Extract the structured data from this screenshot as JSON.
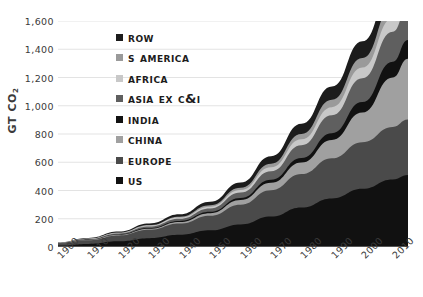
{
  "chart_data": {
    "type": "area",
    "stacked": true,
    "title": "",
    "xlabel": "",
    "ylabel": "GT CO2",
    "ylabel_html": "GT CO<sub>2</sub>",
    "x": [
      1900,
      1910,
      1920,
      1930,
      1940,
      1950,
      1960,
      1970,
      1980,
      1990,
      2000,
      2010,
      2015
    ],
    "xlim": [
      1900,
      2015
    ],
    "ylim": [
      0,
      1600
    ],
    "yticks": [
      0,
      200,
      400,
      600,
      800,
      1000,
      1200,
      1400,
      1600
    ],
    "ytick_labels": [
      "0",
      "200",
      "400",
      "600",
      "800",
      "1,000",
      "1,200",
      "1,400",
      "1,600"
    ],
    "xticks": [
      1900,
      1910,
      1920,
      1930,
      1940,
      1950,
      1960,
      1970,
      1980,
      1990,
      2000,
      2010
    ],
    "xtick_labels": [
      "1900",
      "1910",
      "1920",
      "1930",
      "1940",
      "1950",
      "1960",
      "1970",
      "1980",
      "1990",
      "2000",
      "2010"
    ],
    "grid": true,
    "grid_axis": "y",
    "legend_position": "upper-left-inside",
    "series": [
      {
        "name": "US",
        "color": "#111111",
        "values": [
          10,
          22,
          40,
          62,
          86,
          118,
          160,
          216,
          280,
          344,
          412,
          478,
          510
        ]
      },
      {
        "name": "Europe",
        "color": "#4a4a4a",
        "values": [
          14,
          26,
          42,
          60,
          80,
          104,
          140,
          186,
          236,
          284,
          330,
          372,
          392
        ]
      },
      {
        "name": "China",
        "color": "#a0a0a0",
        "values": [
          1,
          2,
          4,
          7,
          11,
          17,
          32,
          52,
          82,
          130,
          210,
          350,
          430
        ]
      },
      {
        "name": "India",
        "color": "#111111",
        "values": [
          1,
          2,
          3,
          5,
          7,
          10,
          15,
          22,
          32,
          48,
          74,
          112,
          134
        ]
      },
      {
        "name": "Asia ex C&I",
        "color": "#5f5f5f",
        "values": [
          2,
          4,
          7,
          11,
          16,
          24,
          38,
          60,
          90,
          126,
          168,
          212,
          236
        ]
      },
      {
        "name": "Africa",
        "color": "#c8c8c8",
        "values": [
          1,
          2,
          3,
          5,
          8,
          12,
          18,
          28,
          42,
          58,
          76,
          96,
          106
        ]
      },
      {
        "name": "S America",
        "color": "#9a9a9a",
        "values": [
          1,
          2,
          3,
          5,
          7,
          11,
          17,
          26,
          38,
          52,
          68,
          86,
          96
        ]
      },
      {
        "name": "ROW",
        "color": "#1c1c1c",
        "values": [
          2,
          4,
          7,
          11,
          16,
          24,
          36,
          52,
          72,
          94,
          118,
          142,
          156
        ]
      }
    ]
  },
  "legend": {
    "items": [
      {
        "label": "ROW",
        "color": "#1c1c1c"
      },
      {
        "label": "S America",
        "color": "#9a9a9a"
      },
      {
        "label": "Africa",
        "color": "#c8c8c8"
      },
      {
        "label": "Asia ex C&I",
        "color": "#5f5f5f"
      },
      {
        "label": "India",
        "color": "#111111"
      },
      {
        "label": "China",
        "color": "#a0a0a0"
      },
      {
        "label": "Europe",
        "color": "#4a4a4a"
      },
      {
        "label": "US",
        "color": "#111111"
      }
    ]
  },
  "style": {
    "grid_color": "#e3e3e3",
    "axis_color": "#9a9a9a",
    "text_color": "#3a3a3a",
    "background": "#ffffff"
  }
}
